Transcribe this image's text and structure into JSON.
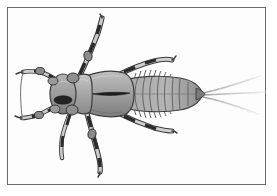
{
  "figure": {
    "domain": "natural-image",
    "medium": "grayscale scientific illustration",
    "subject": "aquatic insect nymph, dorsal view",
    "caption": "",
    "title": "",
    "background_color": "#ffffff",
    "frame": {
      "present": true,
      "color": "#6b6b6b",
      "thickness_px": 1,
      "inset_px": 7,
      "width_px": 259,
      "height_px": 178
    },
    "canvas": {
      "width_px": 277,
      "height_px": 196
    },
    "orientation": "head at left, abdomen and tail filaments at right",
    "palette": {
      "body_light": "#b9b9b9",
      "body_mid": "#9a9a9a",
      "body_dark": "#6f6f6f",
      "outline": "#3a3a3a",
      "leg_band_dark": "#2b2b2b",
      "leg_band_light": "#e4e4e4",
      "filament": "#c8c8c8",
      "paper": "#ffffff"
    },
    "parts": [
      {
        "name": "head",
        "label": "Head",
        "description": "rounded capsule with dark oval eye-patch marking, at left"
      },
      {
        "name": "eye-patch",
        "label": "Eye patch",
        "description": "dark elongated oval on head"
      },
      {
        "name": "pronotum",
        "label": "Pronotum",
        "description": "broad plate behind head"
      },
      {
        "name": "thorax",
        "label": "Thorax / wing pads",
        "description": "large shield with dark median longitudinal split"
      },
      {
        "name": "abdomen",
        "label": "Abdomen",
        "description": "tapering segmented body with about nine transverse rings"
      },
      {
        "name": "gills",
        "label": "Lateral gills",
        "description": "fringed filaments along both sides of the anterior abdomen"
      },
      {
        "name": "cerci",
        "label": "Caudal filaments (cerci)",
        "description": "three pale tail filaments fanning to the right"
      },
      {
        "name": "legs",
        "label": "Legs",
        "description": "six banded legs, dark and light alternating segments"
      },
      {
        "name": "antennae",
        "label": "Antennae",
        "description": "paired segmented appendages projecting forward-left"
      }
    ],
    "counts": {
      "legs": 6,
      "caudal_filaments": 3,
      "abdominal_segments": 9
    }
  }
}
